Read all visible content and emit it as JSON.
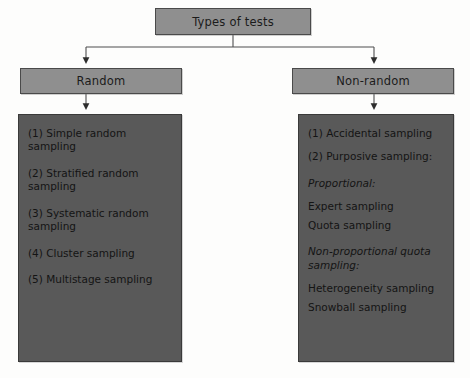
{
  "diagram": {
    "title_node": {
      "label": "Types of tests"
    },
    "branches": [
      {
        "key": "random",
        "header": "Random",
        "items": [
          "(1) Simple random\nsampling",
          "(2) Stratified random\nsampling",
          "(3) Systematic random\nsampling",
          "(4) Cluster sampling",
          "(5) Multistage sampling"
        ]
      },
      {
        "key": "non-random",
        "header": "Non-random",
        "items": [
          "(1) Accidental sampling",
          "(2) Purposive sampling:",
          "Proportional:",
          "Expert sampling",
          "Quota sampling",
          "Non-proportional quota\nsampling:",
          "Heterogeneity sampling",
          "Snowball sampling"
        ]
      }
    ],
    "colors": {
      "node_fill": "#8f8f8f",
      "node_border": "#4a4a4a",
      "panel_fill": "#595959",
      "panel_border": "#3a3a3a",
      "connector": "#4f4f4f",
      "text": "#141414",
      "background": "#fdfdfc"
    }
  }
}
